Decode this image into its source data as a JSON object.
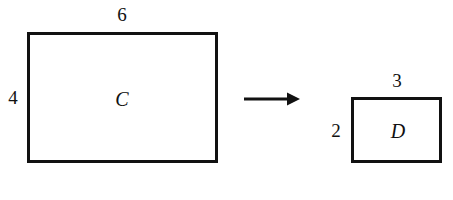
{
  "figure": {
    "background_color": "#ffffff",
    "stroke_color": "#111111"
  },
  "shapes": [
    {
      "id": "rect-c",
      "name": "C",
      "shape_label": "C",
      "width_label": "6",
      "height_label": "4",
      "width_units": 6,
      "height_units": 4
    },
    {
      "id": "rect-d",
      "name": "D",
      "shape_label": "D",
      "width_label": "3",
      "height_label": "2",
      "width_units": 3,
      "height_units": 2
    }
  ],
  "arrow": {
    "icon": "arrow-right-icon",
    "direction": "right",
    "from_shape": "C",
    "to_shape": "D"
  }
}
